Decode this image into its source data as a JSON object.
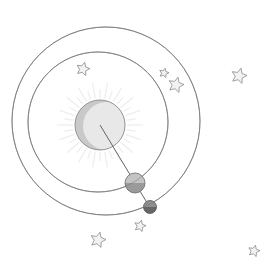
{
  "diagram": {
    "colors": {
      "background": "#ffffff",
      "orbit_stroke": "#7a7a7a",
      "sun_fill": "#e8e8e8",
      "sun_shade": "#c9c9c9",
      "sun_stroke": "#8a8a8a",
      "sun_rays": "#efefef",
      "planet_fill": "#c4c4c4",
      "planet_shade": "#9a9a9a",
      "moon_fill": "#8e8e8e",
      "moon_shade": "#666666",
      "line": "#555555",
      "star_fill": "#f2f2f2",
      "star_stroke": "#8a8a8a"
    },
    "orbits": [
      {
        "name": "outer-orbit",
        "cx": 106,
        "cy": 121,
        "r": 94
      },
      {
        "name": "inner-orbit",
        "cx": 98,
        "cy": 122,
        "r": 70
      }
    ],
    "sun": {
      "cx": 100,
      "cy": 125,
      "r": 25
    },
    "planet": {
      "cx": 135,
      "cy": 183,
      "r": 10
    },
    "moon": {
      "cx": 150,
      "cy": 207,
      "r": 6.5
    },
    "alignment_line": {
      "x1": 100,
      "y1": 125,
      "x2": 152,
      "y2": 211
    },
    "stars": [
      {
        "cx": 83,
        "cy": 69,
        "size": 7
      },
      {
        "cx": 164,
        "cy": 73,
        "size": 5
      },
      {
        "cx": 176,
        "cy": 85,
        "size": 8
      },
      {
        "cx": 239,
        "cy": 76,
        "size": 8
      },
      {
        "cx": 140,
        "cy": 226,
        "size": 6
      },
      {
        "cx": 98,
        "cy": 240,
        "size": 8
      },
      {
        "cx": 254,
        "cy": 251,
        "size": 6
      }
    ]
  }
}
